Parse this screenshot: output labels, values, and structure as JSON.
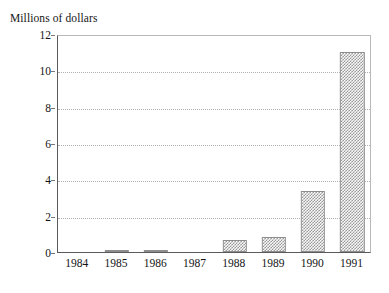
{
  "chart_data": {
    "type": "bar",
    "title": "Millions of dollars",
    "xlabel": "",
    "ylabel": "Millions of dollars",
    "categories": [
      "1984",
      "1985",
      "1986",
      "1987",
      "1988",
      "1989",
      "1990",
      "1991"
    ],
    "values": [
      0,
      0.12,
      0.12,
      0,
      0.65,
      0.85,
      3.35,
      11.0
    ],
    "ylim": [
      0,
      12
    ],
    "yticks": [
      0,
      2,
      4,
      6,
      8,
      10,
      12
    ],
    "ytick_labels": [
      "0",
      "2",
      "4",
      "6",
      "8",
      "10",
      "12"
    ],
    "grid": true,
    "grid_style": "dotted-horizontal",
    "legend": null,
    "legend_position": "none",
    "bar_fill": "#8a8a8a",
    "bar_pattern": "checkerboard-dither",
    "bar_border_color": "#8e8e8e",
    "axis_color": "#5a5a5a",
    "grid_color": "#b0b0b0",
    "background": "#ffffff"
  }
}
